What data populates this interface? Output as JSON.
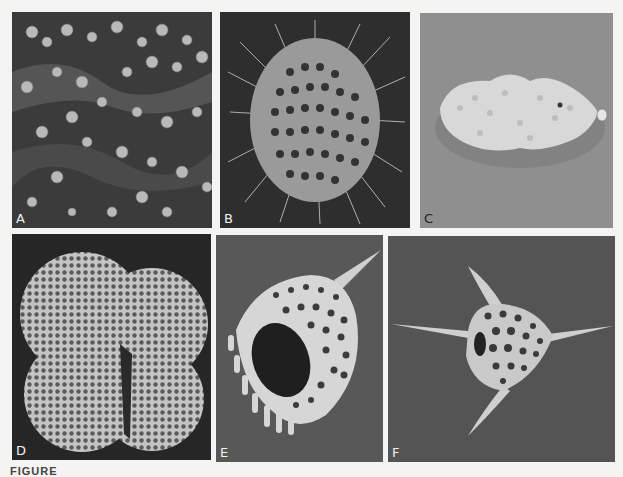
{
  "figure": {
    "caption_partial": "FIGURE",
    "panels": [
      {
        "id": "A",
        "label": "A",
        "subject": "clustered spherical microfossils on rough substrate",
        "background": "#3a3a3a"
      },
      {
        "id": "B",
        "label": "B",
        "subject": "spiny spherical latticed radiolarian",
        "background": "#2e2e2e"
      },
      {
        "id": "C",
        "label": "C",
        "subject": "elongated agglutinated foraminifer test",
        "background": "#8e8e8e"
      },
      {
        "id": "D",
        "label": "D",
        "subject": "globigerinid foraminifer with reticulate chambers",
        "background": "#262626"
      },
      {
        "id": "E",
        "label": "E",
        "subject": "bell-shaped nassellarian radiolarian with apical horn and feet",
        "background": "#5a5a5a"
      },
      {
        "id": "F",
        "label": "F",
        "subject": "triradiate spumellarian radiolarian with three spines",
        "background": "#555555"
      }
    ]
  }
}
